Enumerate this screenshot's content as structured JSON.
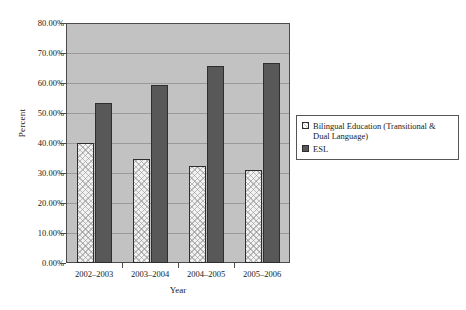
{
  "chart_data": {
    "type": "bar",
    "title": "",
    "xlabel": "Year",
    "ylabel": "Percent",
    "categories": [
      "2002–2003",
      "2003–2004",
      "2004–2005",
      "2005–2006"
    ],
    "series": [
      {
        "name": "Bilingual Education (Transitional & Dual Language)",
        "values": [
          40.0,
          34.7,
          32.3,
          31.0
        ]
      },
      {
        "name": "ESL",
        "values": [
          53.3,
          59.3,
          65.7,
          66.7
        ]
      }
    ],
    "ylim": [
      0,
      80
    ],
    "ytick_values": [
      0,
      10,
      20,
      30,
      40,
      50,
      60,
      70,
      80
    ],
    "ytick_labels": [
      "0.00%",
      "10.00%",
      "20.00%",
      "30.00%",
      "40.00%",
      "50.00%",
      "60.00%",
      "70.00%",
      "80.00%"
    ],
    "grid": true,
    "legend_position": "right",
    "plot_background_color": "#c2c2c2",
    "series_colors": [
      "#f2f2f2",
      "#585858"
    ]
  },
  "legend": {
    "entries": [
      {
        "label": "Bilingual Education (Transitional & Dual Language)",
        "swatch": "legend-swatch-bilingual"
      },
      {
        "label": "ESL",
        "swatch": "legend-swatch-esl"
      }
    ]
  }
}
